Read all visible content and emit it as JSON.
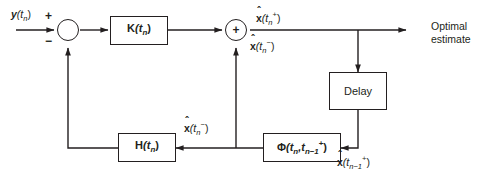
{
  "diagram": {
    "stroke_color": "#231f20",
    "background": "#ffffff",
    "input": {
      "label_main": "y",
      "label_arg": "(t",
      "label_sub": "n",
      "label_close": ")",
      "plus_sign": "+",
      "minus_sign": "−"
    },
    "blocks": [
      {
        "name": "gain-block",
        "symbol": "K",
        "arg_open": "(t",
        "sub": "n",
        "arg_close": ")",
        "bold": true
      },
      {
        "name": "delay-block",
        "symbol": "Delay",
        "bold": false
      },
      {
        "name": "measurement-block",
        "symbol": "H",
        "arg_open": "(t",
        "sub": "n",
        "arg_close": ")",
        "bold": true
      },
      {
        "name": "transition-block",
        "symbol": "Φ",
        "arg_open": "(t",
        "sub": "n",
        "mid": ",t",
        "sub2": "n−1",
        "sup2": "+",
        "arg_close": ")",
        "bold": true
      }
    ],
    "junctions": [
      {
        "name": "summing-junction-error",
        "symbol": ""
      },
      {
        "name": "summing-junction-update",
        "symbol": "+"
      }
    ],
    "signals": {
      "posterior": {
        "hat": "ˆ",
        "var": "x",
        "open": "(t",
        "sub": "n",
        "sup": "+",
        "close": ")"
      },
      "prior": {
        "hat": "ˆ",
        "var": "x",
        "open": "(t",
        "sub": "n",
        "sup": "−",
        "close": ")"
      },
      "prior_feedback": {
        "hat": "ˆ",
        "var": "x",
        "open": "(t",
        "sub": "n",
        "sup": "−",
        "close": ")"
      },
      "delayed_posterior": {
        "hat": "ˆ",
        "var": "x",
        "open": "(t",
        "sub": "n−1",
        "sup": "+",
        "close": ")"
      }
    },
    "output": {
      "line1": "Optimal",
      "line2": "estimate"
    }
  }
}
